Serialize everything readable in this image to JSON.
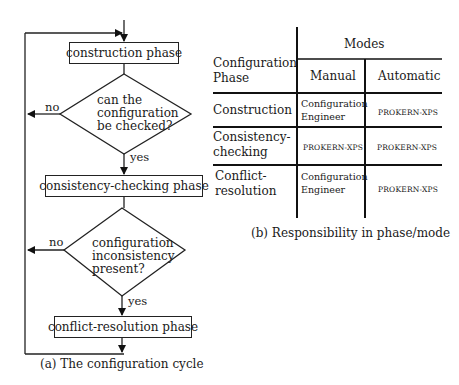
{
  "flowchart": {
    "boxes": {
      "construction": "construction phase",
      "consistency": "consistency-checking phase",
      "conflict": "conflict-resolution phase"
    },
    "decision1": {
      "line1": "can the",
      "line2": "configuration",
      "line3": "be checked?"
    },
    "decision2": {
      "line1": "configuration",
      "line2": "inconsistency",
      "line3": "present?"
    },
    "labels": {
      "no1": "no",
      "yes1": "yes",
      "no2": "no",
      "yes2": "yes"
    },
    "caption": "(a) The configuration cycle"
  },
  "table": {
    "header": {
      "phase_line1": "Configuration",
      "phase_line2": "Phase",
      "modes": "Modes",
      "manual": "Manual",
      "automatic": "Automatic"
    },
    "rows": [
      {
        "phase_line1": "Construction",
        "phase_line2": "",
        "manual_line1": "Configuration",
        "manual_line2": "Engineer",
        "automatic": "PROKERN-XPS"
      },
      {
        "phase_line1": "Consistency-",
        "phase_line2": "checking",
        "manual_line1": "PROKERN-XPS",
        "manual_line2": "",
        "automatic": "PROKERN-XPS"
      },
      {
        "phase_line1": "Conflict-",
        "phase_line2": "resolution",
        "manual_line1": "Configuration",
        "manual_line2": "Engineer",
        "automatic": "PROKERN-XPS"
      }
    ],
    "caption": "(b) Responsibility in phase/mode"
  }
}
